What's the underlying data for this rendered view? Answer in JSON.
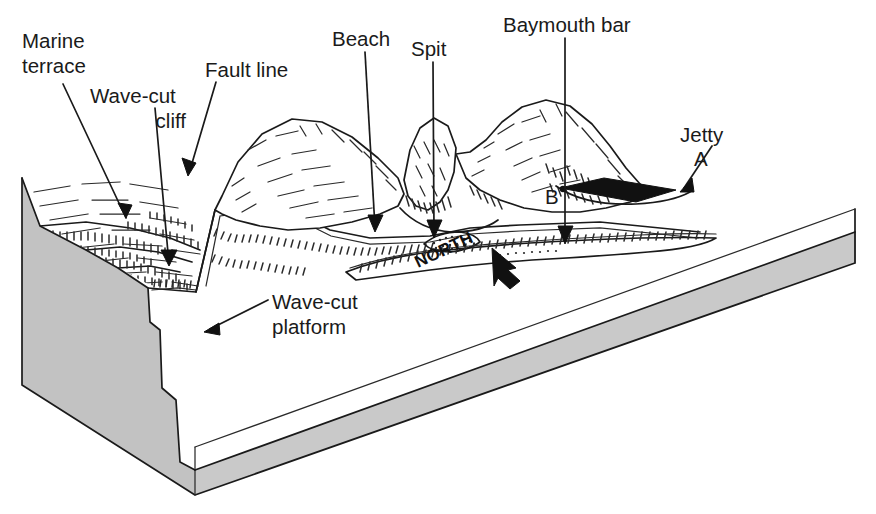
{
  "diagram": {
    "type": "geological-block-diagram",
    "background_color": "#ffffff",
    "ink_color": "#1a1a1a",
    "cutaway_fill_color": "#c9c9c9",
    "jetty_fill_color": "#111111"
  },
  "labels": {
    "marine_terrace": "Marine\nterrace",
    "marine_terrace_line1": "Marine",
    "marine_terrace_line2": "terrace",
    "wave_cut_cliff_line1": "Wave-cut",
    "wave_cut_cliff_line2": "cliff",
    "fault_line": "Fault line",
    "beach": "Beach",
    "spit": "Spit",
    "baymouth_bar": "Baymouth bar",
    "jetty": "Jetty",
    "wave_cut_platform_line1": "Wave-cut",
    "wave_cut_platform_line2": "platform",
    "north": "NORTH"
  },
  "point_markers": {
    "a": "A",
    "b": "B"
  },
  "compass": {
    "label": "NORTH",
    "rotation_degrees": -25,
    "arrow_direction": "up-left"
  },
  "features": [
    {
      "id": "marine-terrace",
      "label": "Marine terrace"
    },
    {
      "id": "wave-cut-cliff",
      "label": "Wave-cut cliff"
    },
    {
      "id": "fault-line",
      "label": "Fault line"
    },
    {
      "id": "beach",
      "label": "Beach"
    },
    {
      "id": "spit",
      "label": "Spit"
    },
    {
      "id": "baymouth-bar",
      "label": "Baymouth bar"
    },
    {
      "id": "jetty",
      "label": "Jetty"
    },
    {
      "id": "wave-cut-platform",
      "label": "Wave-cut platform"
    },
    {
      "id": "point-a",
      "label": "A"
    },
    {
      "id": "point-b",
      "label": "B"
    }
  ]
}
